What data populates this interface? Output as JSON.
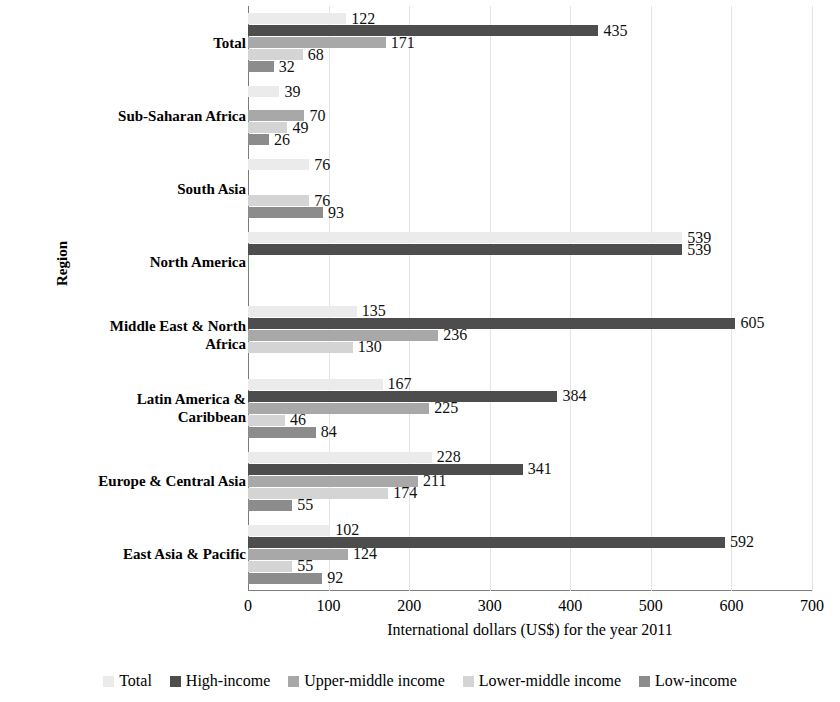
{
  "chart_data": {
    "type": "bar",
    "orientation": "horizontal",
    "title": "",
    "xlabel": "International dollars (US$) for the year 2011",
    "ylabel": "Region",
    "xlim": [
      0,
      700
    ],
    "xticks": [
      0,
      100,
      200,
      300,
      400,
      500,
      600,
      700
    ],
    "grid": true,
    "legend_position": "bottom",
    "categories": [
      "East Asia & Pacific",
      "Europe & Central Asia",
      "Latin America & Caribbean",
      "Middle East & North Africa",
      "North America",
      "South Asia",
      "Sub-Saharan Africa",
      "Total"
    ],
    "series": [
      {
        "name": "Total",
        "color": "#ebebeb",
        "values": [
          102,
          228,
          167,
          135,
          539,
          76,
          39,
          122
        ]
      },
      {
        "name": "High-income",
        "color": "#4d4d4d",
        "values": [
          592,
          341,
          384,
          605,
          539,
          null,
          null,
          435
        ]
      },
      {
        "name": "Upper-middle income",
        "color": "#a8a8a8",
        "values": [
          124,
          211,
          225,
          236,
          null,
          null,
          70,
          171
        ]
      },
      {
        "name": "Lower-middle income",
        "color": "#d4d4d4",
        "values": [
          55,
          174,
          46,
          130,
          null,
          76,
          49,
          68
        ]
      },
      {
        "name": "Low-income",
        "color": "#8c8c8c",
        "values": [
          92,
          55,
          84,
          null,
          null,
          93,
          26,
          32
        ]
      }
    ]
  },
  "axis": {
    "x_title": "International dollars (US$) for the year 2011",
    "y_title": "Region",
    "x_tick_labels": [
      "0",
      "100",
      "200",
      "300",
      "400",
      "500",
      "600",
      "700"
    ]
  },
  "legend": {
    "items": [
      {
        "label": "Total",
        "color": "#ebebeb"
      },
      {
        "label": "High-income",
        "color": "#4d4d4d"
      },
      {
        "label": "Upper-middle income",
        "color": "#a8a8a8"
      },
      {
        "label": "Lower-middle income",
        "color": "#d4d4d4"
      },
      {
        "label": "Low-income",
        "color": "#8c8c8c"
      }
    ]
  },
  "groups": [
    {
      "label": "Total",
      "label_lines": [
        "Total"
      ],
      "bars": [
        {
          "series": "Total",
          "value": 122,
          "display": "122",
          "color": "#ebebeb"
        },
        {
          "series": "High-income",
          "value": 435,
          "display": "435",
          "color": "#4d4d4d"
        },
        {
          "series": "Upper-middle income",
          "value": 171,
          "display": "171",
          "color": "#a8a8a8"
        },
        {
          "series": "Lower-middle income",
          "value": 68,
          "display": "68",
          "color": "#d4d4d4"
        },
        {
          "series": "Low-income",
          "value": 32,
          "display": "32",
          "color": "#8c8c8c"
        }
      ]
    },
    {
      "label": "Sub-Saharan Africa",
      "label_lines": [
        "Sub-Saharan Africa"
      ],
      "bars": [
        {
          "series": "Total",
          "value": 39,
          "display": "39",
          "color": "#ebebeb"
        },
        {
          "series": "High-income",
          "value": 0,
          "display": "",
          "color": "#4d4d4d"
        },
        {
          "series": "Upper-middle income",
          "value": 70,
          "display": "70",
          "color": "#a8a8a8"
        },
        {
          "series": "Lower-middle income",
          "value": 49,
          "display": "49",
          "color": "#d4d4d4"
        },
        {
          "series": "Low-income",
          "value": 26,
          "display": "26",
          "color": "#8c8c8c"
        }
      ]
    },
    {
      "label": "South Asia",
      "label_lines": [
        "South Asia"
      ],
      "bars": [
        {
          "series": "Total",
          "value": 76,
          "display": "76",
          "color": "#ebebeb"
        },
        {
          "series": "High-income",
          "value": 0,
          "display": "",
          "color": "#4d4d4d"
        },
        {
          "series": "Upper-middle income",
          "value": 0,
          "display": "",
          "color": "#a8a8a8"
        },
        {
          "series": "Lower-middle income",
          "value": 76,
          "display": "76",
          "color": "#d4d4d4"
        },
        {
          "series": "Low-income",
          "value": 93,
          "display": "93",
          "color": "#8c8c8c"
        }
      ]
    },
    {
      "label": "North America",
      "label_lines": [
        "North America"
      ],
      "bars": [
        {
          "series": "Total",
          "value": 539,
          "display": "539",
          "color": "#ebebeb"
        },
        {
          "series": "High-income",
          "value": 539,
          "display": "539",
          "color": "#4d4d4d"
        },
        {
          "series": "Upper-middle income",
          "value": 0,
          "display": "",
          "color": "#a8a8a8"
        },
        {
          "series": "Lower-middle income",
          "value": 0,
          "display": "",
          "color": "#d4d4d4"
        },
        {
          "series": "Low-income",
          "value": 0,
          "display": "",
          "color": "#8c8c8c"
        }
      ]
    },
    {
      "label": "Middle East & North Africa",
      "label_lines": [
        "Middle East & North",
        "Africa"
      ],
      "bars": [
        {
          "series": "Total",
          "value": 135,
          "display": "135",
          "color": "#ebebeb"
        },
        {
          "series": "High-income",
          "value": 605,
          "display": "605",
          "color": "#4d4d4d"
        },
        {
          "series": "Upper-middle income",
          "value": 236,
          "display": "236",
          "color": "#a8a8a8"
        },
        {
          "series": "Lower-middle income",
          "value": 130,
          "display": "130",
          "color": "#d4d4d4"
        },
        {
          "series": "Low-income",
          "value": 0,
          "display": "",
          "color": "#8c8c8c"
        }
      ]
    },
    {
      "label": "Latin America & Caribbean",
      "label_lines": [
        "Latin America &",
        "Caribbean"
      ],
      "bars": [
        {
          "series": "Total",
          "value": 167,
          "display": "167",
          "color": "#ebebeb"
        },
        {
          "series": "High-income",
          "value": 384,
          "display": "384",
          "color": "#4d4d4d"
        },
        {
          "series": "Upper-middle income",
          "value": 225,
          "display": "225",
          "color": "#a8a8a8"
        },
        {
          "series": "Lower-middle income",
          "value": 46,
          "display": "46",
          "color": "#d4d4d4"
        },
        {
          "series": "Low-income",
          "value": 84,
          "display": "84",
          "color": "#8c8c8c"
        }
      ]
    },
    {
      "label": "Europe & Central Asia",
      "label_lines": [
        "Europe & Central Asia"
      ],
      "bars": [
        {
          "series": "Total",
          "value": 228,
          "display": "228",
          "color": "#ebebeb"
        },
        {
          "series": "High-income",
          "value": 341,
          "display": "341",
          "color": "#4d4d4d"
        },
        {
          "series": "Upper-middle income",
          "value": 211,
          "display": "211",
          "color": "#a8a8a8"
        },
        {
          "series": "Lower-middle income",
          "value": 174,
          "display": "174",
          "color": "#d4d4d4"
        },
        {
          "series": "Low-income",
          "value": 55,
          "display": "55",
          "color": "#8c8c8c"
        }
      ]
    },
    {
      "label": "East Asia & Pacific",
      "label_lines": [
        "East Asia & Pacific"
      ],
      "bars": [
        {
          "series": "Total",
          "value": 102,
          "display": "102",
          "color": "#ebebeb"
        },
        {
          "series": "High-income",
          "value": 592,
          "display": "592",
          "color": "#4d4d4d"
        },
        {
          "series": "Upper-middle income",
          "value": 124,
          "display": "124",
          "color": "#a8a8a8"
        },
        {
          "series": "Lower-middle income",
          "value": 55,
          "display": "55",
          "color": "#d4d4d4"
        },
        {
          "series": "Low-income",
          "value": 92,
          "display": "92",
          "color": "#8c8c8c"
        }
      ]
    }
  ]
}
